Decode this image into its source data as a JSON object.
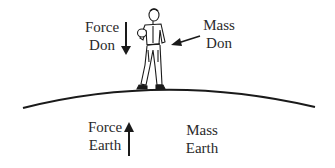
{
  "diagram": {
    "force_don": {
      "line1": "Force",
      "line2": "Don"
    },
    "mass_don": {
      "line1": "Mass",
      "line2": "Don"
    },
    "force_earth": {
      "line1": "Force",
      "line2": "Earth"
    },
    "mass_earth": {
      "line1": "Mass",
      "line2": "Earth"
    },
    "figure": "person-standing-icon",
    "ground": "earth-surface-curve"
  },
  "colors": {
    "ink": "#222222",
    "background": "#ffffff"
  }
}
